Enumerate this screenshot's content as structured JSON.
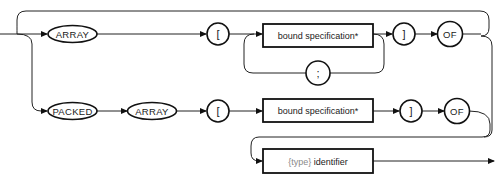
{
  "diagram": {
    "kind": "syntax-diagram",
    "row1": {
      "keyword_array": "ARRAY",
      "open_bracket": "[",
      "bound_spec": "bound specification*",
      "separator": ";",
      "close_bracket": "]",
      "of": "OF"
    },
    "row2": {
      "keyword_packed": "PACKED",
      "keyword_array": "ARRAY",
      "open_bracket": "[",
      "bound_spec": "bound specification*",
      "close_bracket": "]",
      "of": "OF"
    },
    "row3": {
      "type_prefix": "{type}",
      "identifier": " identifier"
    },
    "colors": {
      "stroke": "#111111",
      "background": "#ffffff",
      "annotation_gray": "#8a8a8a"
    }
  }
}
